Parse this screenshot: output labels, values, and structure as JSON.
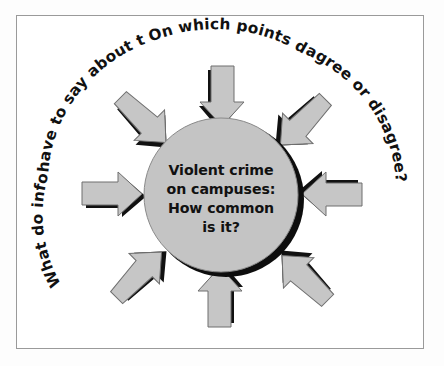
{
  "figure": {
    "frame_color": "#9a9a9a",
    "background_color": "#ffffff"
  },
  "center": {
    "name": "central-question-bubble",
    "fill_color": "#c4c4c4",
    "shadow_color": "#0d0d0d",
    "lines": [
      "Violent crime",
      "on campuses:",
      "How common",
      "is it?"
    ]
  },
  "ring": {
    "name": "circular-prompt-text",
    "text": "What do informed sources have to say about this topic? On which points do sources agree or disagree?",
    "segments": [
      "What do informed sources",
      "have to say about this topic?",
      "On which points do sources",
      "agree or disagree?"
    ],
    "text_color": "#111111"
  },
  "arrows": {
    "count": 8,
    "fill_color": "#c6c6c6",
    "outline_color": "#6f6f6f",
    "shadow_color": "#111111",
    "items": [
      {
        "name": "arrow-from-top",
        "direction": "down",
        "angle_deg": 90
      },
      {
        "name": "arrow-from-top-right",
        "direction": "down-left",
        "angle_deg": 45
      },
      {
        "name": "arrow-from-right",
        "direction": "left",
        "angle_deg": 0
      },
      {
        "name": "arrow-from-bottom-right",
        "direction": "up-left",
        "angle_deg": 315
      },
      {
        "name": "arrow-from-bottom",
        "direction": "up",
        "angle_deg": 270
      },
      {
        "name": "arrow-from-bottom-left",
        "direction": "up-right",
        "angle_deg": 225
      },
      {
        "name": "arrow-from-left",
        "direction": "right",
        "angle_deg": 180
      },
      {
        "name": "arrow-from-top-left",
        "direction": "down-right",
        "angle_deg": 135
      }
    ]
  }
}
